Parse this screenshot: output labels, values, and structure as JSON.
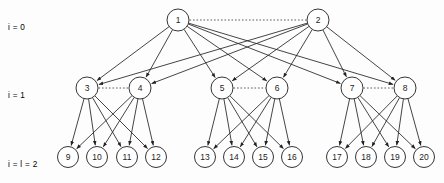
{
  "figure": {
    "type": "layered-tree-diagram",
    "width": 444,
    "height": 183,
    "background_color": "#fdfdfd",
    "edge_color": "#232323",
    "node_fill": "#ffffff",
    "node_stroke": "#2a2a2a",
    "sibling_link_style": "dotted"
  },
  "level_labels": [
    {
      "id": "level-0",
      "text": "i = 0",
      "x": 8,
      "y": 16
    },
    {
      "id": "level-1",
      "text": "i = 1",
      "x": 8,
      "y": 84
    },
    {
      "id": "level-2",
      "text": "i = l = 2",
      "x": 8,
      "y": 153
    }
  ],
  "nodes": [
    {
      "id": 1,
      "label": "1",
      "level": 0,
      "cx": 178,
      "cy": 20,
      "r": 11
    },
    {
      "id": 2,
      "label": "2",
      "level": 0,
      "cx": 318,
      "cy": 20,
      "r": 11
    },
    {
      "id": 3,
      "label": "3",
      "level": 1,
      "cx": 87,
      "cy": 88,
      "r": 11
    },
    {
      "id": 4,
      "label": "4",
      "level": 1,
      "cx": 140,
      "cy": 88,
      "r": 11
    },
    {
      "id": 5,
      "label": "5",
      "level": 1,
      "cx": 222,
      "cy": 88,
      "r": 11
    },
    {
      "id": 6,
      "label": "6",
      "level": 1,
      "cx": 277,
      "cy": 88,
      "r": 11
    },
    {
      "id": 7,
      "label": "7",
      "level": 1,
      "cx": 352,
      "cy": 88,
      "r": 11
    },
    {
      "id": 8,
      "label": "8",
      "level": 1,
      "cx": 405,
      "cy": 88,
      "r": 11
    },
    {
      "id": 9,
      "label": "9",
      "level": 2,
      "cx": 68,
      "cy": 157,
      "r": 10.5
    },
    {
      "id": 10,
      "label": "10",
      "level": 2,
      "cx": 97,
      "cy": 157,
      "r": 10.5
    },
    {
      "id": 11,
      "label": "11",
      "level": 2,
      "cx": 127,
      "cy": 157,
      "r": 10.5
    },
    {
      "id": 12,
      "label": "12",
      "level": 2,
      "cx": 156,
      "cy": 157,
      "r": 10.5
    },
    {
      "id": 13,
      "label": "13",
      "level": 2,
      "cx": 205,
      "cy": 157,
      "r": 10.5
    },
    {
      "id": 14,
      "label": "14",
      "level": 2,
      "cx": 234,
      "cy": 157,
      "r": 10.5
    },
    {
      "id": 15,
      "label": "15",
      "level": 2,
      "cx": 263,
      "cy": 157,
      "r": 10.5
    },
    {
      "id": 16,
      "label": "16",
      "level": 2,
      "cx": 292,
      "cy": 157,
      "r": 10.5
    },
    {
      "id": 17,
      "label": "17",
      "level": 2,
      "cx": 337,
      "cy": 157,
      "r": 10.5
    },
    {
      "id": 18,
      "label": "18",
      "level": 2,
      "cx": 366,
      "cy": 157,
      "r": 10.5
    },
    {
      "id": 19,
      "label": "19",
      "level": 2,
      "cx": 395,
      "cy": 157,
      "r": 10.5
    },
    {
      "id": 20,
      "label": "20",
      "level": 2,
      "cx": 424,
      "cy": 157,
      "r": 10.5
    }
  ],
  "edges": [
    {
      "from": 1,
      "to": 3
    },
    {
      "from": 1,
      "to": 4
    },
    {
      "from": 1,
      "to": 5
    },
    {
      "from": 1,
      "to": 6
    },
    {
      "from": 1,
      "to": 7
    },
    {
      "from": 1,
      "to": 8
    },
    {
      "from": 2,
      "to": 3
    },
    {
      "from": 2,
      "to": 4
    },
    {
      "from": 2,
      "to": 5
    },
    {
      "from": 2,
      "to": 6
    },
    {
      "from": 2,
      "to": 7
    },
    {
      "from": 2,
      "to": 8
    },
    {
      "from": 3,
      "to": 9
    },
    {
      "from": 3,
      "to": 10
    },
    {
      "from": 3,
      "to": 11
    },
    {
      "from": 3,
      "to": 12
    },
    {
      "from": 4,
      "to": 9
    },
    {
      "from": 4,
      "to": 10
    },
    {
      "from": 4,
      "to": 11
    },
    {
      "from": 4,
      "to": 12
    },
    {
      "from": 5,
      "to": 13
    },
    {
      "from": 5,
      "to": 14
    },
    {
      "from": 5,
      "to": 15
    },
    {
      "from": 5,
      "to": 16
    },
    {
      "from": 6,
      "to": 13
    },
    {
      "from": 6,
      "to": 14
    },
    {
      "from": 6,
      "to": 15
    },
    {
      "from": 6,
      "to": 16
    },
    {
      "from": 7,
      "to": 17
    },
    {
      "from": 7,
      "to": 18
    },
    {
      "from": 7,
      "to": 19
    },
    {
      "from": 7,
      "to": 20
    },
    {
      "from": 8,
      "to": 17
    },
    {
      "from": 8,
      "to": 18
    },
    {
      "from": 8,
      "to": 19
    },
    {
      "from": 8,
      "to": 20
    }
  ],
  "sibling_links": [
    {
      "from": 1,
      "to": 2
    },
    {
      "from": 3,
      "to": 4
    },
    {
      "from": 5,
      "to": 6
    },
    {
      "from": 7,
      "to": 8
    }
  ]
}
